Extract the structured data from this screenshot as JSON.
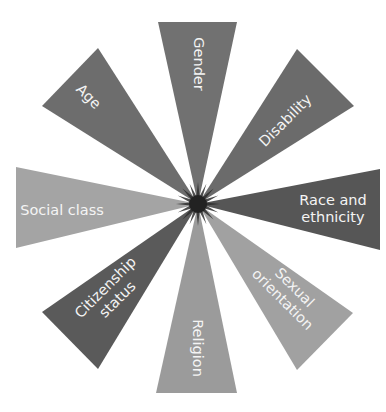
{
  "diagram": {
    "type": "radial-wedge-diagram",
    "center": {
      "x": 198,
      "y": 204
    },
    "background": "#ffffff",
    "label_color": "#f4f4f4",
    "star_color": "#2e2e2e",
    "wedges": [
      {
        "id": "gender",
        "lines": [
          "Gender"
        ],
        "color": "#717171",
        "points": [
          [
            158,
            22
          ],
          [
            237,
            22
          ]
        ],
        "label_pos": {
          "x": 198,
          "y": 64
        },
        "rotation": 90
      },
      {
        "id": "disability",
        "lines": [
          "Disability"
        ],
        "color": "#6b6b6b",
        "points": [
          [
            297,
            49
          ],
          [
            354,
            106
          ]
        ],
        "label_pos": {
          "x": 286,
          "y": 121
        },
        "rotation": -45
      },
      {
        "id": "race-and-ethnicity",
        "lines": [
          "Race and",
          "ethnicity"
        ],
        "color": "#565656",
        "points": [
          [
            380,
            169
          ],
          [
            380,
            250
          ]
        ],
        "label_pos": {
          "x": 333,
          "y": 209
        },
        "rotation": 0
      },
      {
        "id": "sexual-orientation",
        "lines": [
          "Sexual",
          "orientation"
        ],
        "color": "#a1a1a1",
        "points": [
          [
            353,
            313
          ],
          [
            297,
            370
          ]
        ],
        "label_pos": {
          "x": 288,
          "y": 294
        },
        "rotation": 45
      },
      {
        "id": "religion",
        "lines": [
          "Religion"
        ],
        "color": "#9b9b9b",
        "points": [
          [
            237,
            393
          ],
          [
            156,
            393
          ]
        ],
        "label_pos": {
          "x": 197,
          "y": 348
        },
        "rotation": 90
      },
      {
        "id": "citizenship-status",
        "lines": [
          "Citizenship",
          "status"
        ],
        "color": "#5a5a5a",
        "points": [
          [
            98,
            369
          ],
          [
            42,
            312
          ]
        ],
        "label_pos": {
          "x": 112,
          "y": 294
        },
        "rotation": -45
      },
      {
        "id": "social-class",
        "lines": [
          "Social class"
        ],
        "color": "#a4a4a4",
        "points": [
          [
            16,
            248
          ],
          [
            16,
            167
          ]
        ],
        "label_pos": {
          "x": 62,
          "y": 211
        },
        "rotation": 0
      },
      {
        "id": "age",
        "lines": [
          "Age"
        ],
        "color": "#6d6d6d",
        "points": [
          [
            42,
            106
          ],
          [
            98,
            48
          ]
        ],
        "label_pos": {
          "x": 88,
          "y": 97
        },
        "rotation": 45
      }
    ]
  }
}
